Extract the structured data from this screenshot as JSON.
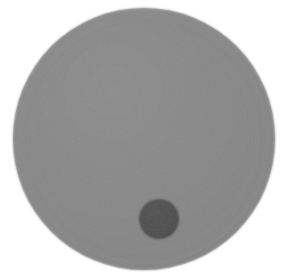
{
  "canvas": {
    "width": 287,
    "height": 280,
    "background_color": "#ffffff",
    "description": "Grayscale photographic image of a large flat gray disc on a white background with a smaller darker gray disc near its lower center."
  },
  "shapes": {
    "large_disc": {
      "name": "large-gray-disc",
      "center_x": 144,
      "center_y": 139,
      "radius": 131,
      "fill_color": "#8a8a8a",
      "edge_softness_px": 1.5,
      "texture": "fine-grain-noise",
      "shading": "slightly lighter toward upper-left, marginally darker at right rim",
      "rim_artifact": "faint concentric ring banding along right edge"
    },
    "small_disc": {
      "name": "small-dark-disc",
      "center_x": 159,
      "center_y": 219,
      "radius": 20,
      "fill_color": "#555555",
      "edge_softness_px": 1.2,
      "texture": "fine-grain-noise",
      "shading": "slightly darker toward lower-right"
    }
  },
  "palette": {
    "background": "#ffffff",
    "disc_gray": "#8a8a8a",
    "disc_gray_light": "#949494",
    "disc_gray_dark": "#7e7e7e",
    "small_disc_gray": "#555555",
    "small_disc_gray_dark": "#4a4a4a"
  }
}
